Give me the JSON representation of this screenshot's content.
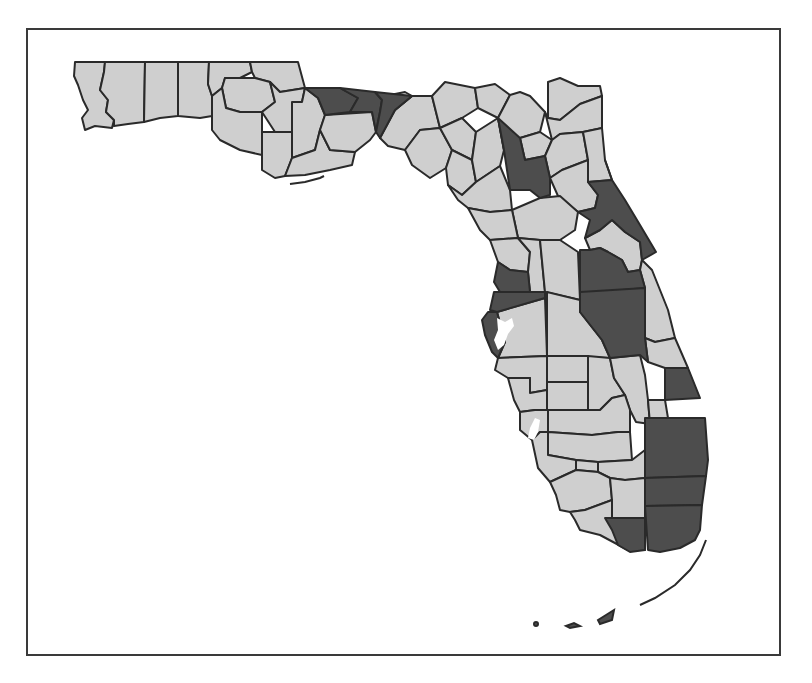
{
  "map": {
    "title": "Florida counties choropleth",
    "region": "Florida",
    "legend": [],
    "colors": {
      "highlighted": "#4d4d4d",
      "other": "#cfcfcf",
      "border": "#2a2a2a",
      "water": "#ffffff",
      "frame": "#3a3a3a"
    },
    "categories": [
      {
        "name": "highlighted",
        "color": "#4d4d4d"
      },
      {
        "name": "other",
        "color": "#cfcfcf"
      }
    ]
  }
}
